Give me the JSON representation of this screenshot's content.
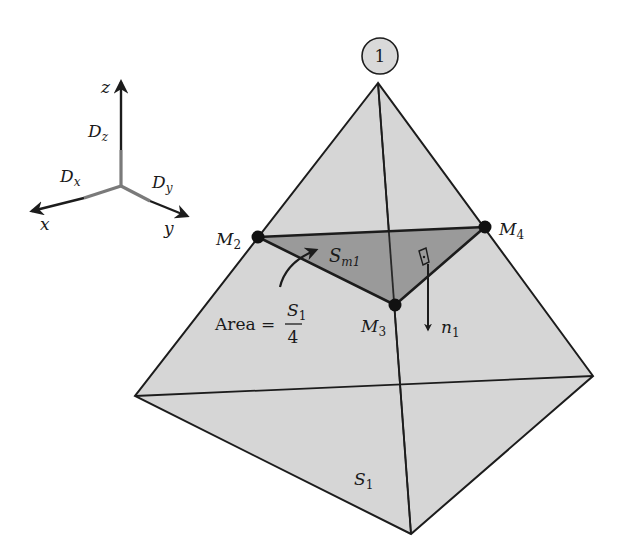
{
  "figure": {
    "node_label": "1",
    "colors": {
      "face_fill": "#d6d6d6",
      "section_fill": "#9a9a9a",
      "line": "#1c1c1c",
      "axis_component": "#7a7a7a",
      "circle_fill": "#d9d9d9"
    },
    "axes": {
      "x_label": "x",
      "y_label": "y",
      "z_label": "z",
      "dx_main": "D",
      "dx_sub": "x",
      "dy_main": "D",
      "dy_sub": "y",
      "dz_main": "D",
      "dz_sub": "z"
    },
    "points": {
      "m2_main": "M",
      "m2_sub": "2",
      "m3_main": "M",
      "m3_sub": "3",
      "m4_main": "M",
      "m4_sub": "4"
    },
    "section": {
      "label_main": "S",
      "label_sub": "m1"
    },
    "area": {
      "prefix": "Area =",
      "numerator_main": "S",
      "numerator_sub": "1",
      "denominator": "4"
    },
    "normal": {
      "label_main": "n",
      "label_sub": "1"
    },
    "face": {
      "label_main": "S",
      "label_sub": "1"
    }
  }
}
